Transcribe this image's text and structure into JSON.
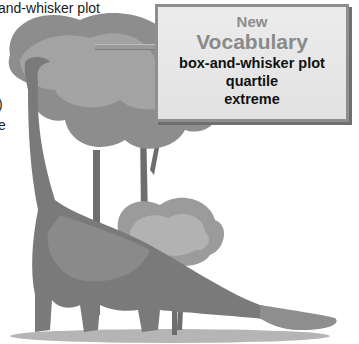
{
  "partial_text": {
    "line1": "and-whisker plot",
    "line2": ")",
    "line3": "e"
  },
  "vocab_box": {
    "heading_small": "New",
    "heading_large": "Vocabulary",
    "terms": [
      "box-and-whisker plot",
      "quartile",
      "extreme"
    ]
  },
  "illustration": {
    "subject": "brachiosaurus-dinosaur-with-trees",
    "style": "grayscale"
  },
  "colors": {
    "box_bg": "#e6e6e6",
    "box_border": "#8f8f8f",
    "heading_gray": "#8a8a8a",
    "term_black": "#111111"
  }
}
